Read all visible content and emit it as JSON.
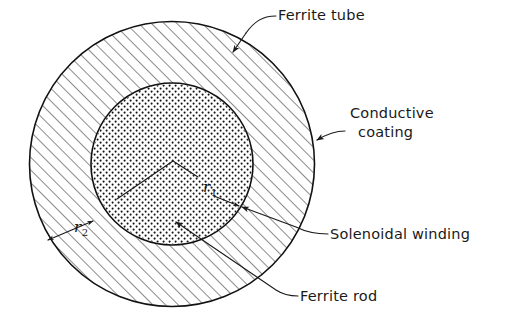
{
  "figure": {
    "type": "cross-section-diagram",
    "title": "",
    "background_color": "#ffffff",
    "ink_color": "#1a1a1a"
  },
  "geometry": {
    "center": {
      "x": 172,
      "y": 164
    },
    "outer_circle": {
      "radius": 143,
      "fill_pattern": "diagonal-hatch",
      "hatch_angle_deg": -45
    },
    "inner_circle": {
      "radius": 81,
      "fill_pattern": "stipple-dots"
    },
    "radius_inner_label": "r1",
    "radius_outer_label": "r2"
  },
  "labels": {
    "ferrite_tube": {
      "text": "Ferrite tube",
      "x": 278,
      "y": 20,
      "anchor": "start"
    },
    "conductive_coating_line1": {
      "text": "Conductive",
      "x": 350,
      "y": 118,
      "anchor": "start"
    },
    "conductive_coating_line2": {
      "text": "coating",
      "x": 358,
      "y": 137,
      "anchor": "start"
    },
    "solenoidal_winding": {
      "text": "Solenoidal winding",
      "x": 330,
      "y": 239,
      "anchor": "start"
    },
    "ferrite_rod": {
      "text": "Ferrite rod",
      "x": 300,
      "y": 301,
      "anchor": "start"
    }
  },
  "radius_markers": {
    "r1": {
      "base": "r",
      "subscript": "1",
      "x": 203,
      "y": 192
    },
    "r2": {
      "base": "r",
      "subscript": "2",
      "x": 74,
      "y": 232
    }
  },
  "colors": {
    "ink": "#1a1a1a",
    "hatch": "#222222",
    "dots": "#141414",
    "paper": "#ffffff"
  }
}
